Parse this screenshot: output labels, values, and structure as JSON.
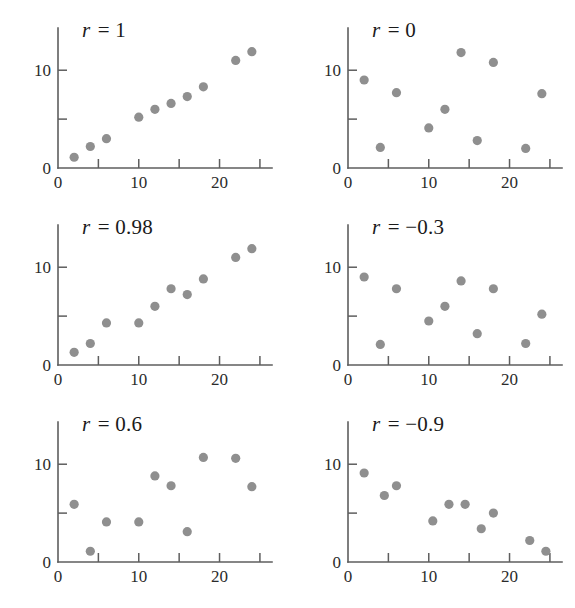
{
  "figure": {
    "background_color": "#ffffff",
    "dot_color": "#8f8f8f",
    "axis_color": "#5e5e5e",
    "text_color": "#1a1a1a",
    "rows": 3,
    "columns": 2
  },
  "chart_data": [
    {
      "type": "scatter",
      "title": "r = 1",
      "r_symbol": "r",
      "r_value": "= 1",
      "xlabel": "",
      "ylabel": "",
      "xlim": [
        0,
        26
      ],
      "ylim": [
        0,
        13.5
      ],
      "grid": false,
      "legend": "none",
      "xticks": [
        0,
        5,
        10,
        15,
        20,
        25
      ],
      "xticklabels": [
        "0",
        "",
        "10",
        "",
        "20",
        ""
      ],
      "yticks": [
        0,
        5,
        10
      ],
      "yticklabels": [
        "0",
        "",
        "10"
      ],
      "x": [
        2,
        4,
        6,
        10,
        12,
        14,
        16,
        18,
        22,
        24
      ],
      "y": [
        1.1,
        2.2,
        3.0,
        5.2,
        6.0,
        6.6,
        7.3,
        8.3,
        11.0,
        11.9
      ]
    },
    {
      "type": "scatter",
      "title": "r = 0",
      "r_symbol": "r",
      "r_value": "= 0",
      "xlabel": "",
      "ylabel": "",
      "xlim": [
        0,
        26
      ],
      "ylim": [
        0,
        13.5
      ],
      "grid": false,
      "legend": "none",
      "xticks": [
        0,
        5,
        10,
        15,
        20,
        25
      ],
      "xticklabels": [
        "0",
        "",
        "10",
        "",
        "20",
        ""
      ],
      "yticks": [
        0,
        5,
        10
      ],
      "yticklabels": [
        "0",
        "",
        "10"
      ],
      "x": [
        2,
        4,
        6,
        10,
        12,
        14,
        16,
        18,
        22,
        24
      ],
      "y": [
        9.0,
        2.1,
        7.7,
        4.1,
        6.0,
        11.8,
        2.8,
        10.8,
        2.0,
        7.6
      ]
    },
    {
      "type": "scatter",
      "title": "r = 0.98",
      "r_symbol": "r",
      "r_value": "= 0.98",
      "xlabel": "",
      "ylabel": "",
      "xlim": [
        0,
        26
      ],
      "ylim": [
        0,
        13.5
      ],
      "grid": false,
      "legend": "none",
      "xticks": [
        0,
        5,
        10,
        15,
        20,
        25
      ],
      "xticklabels": [
        "0",
        "",
        "10",
        "",
        "20",
        ""
      ],
      "yticks": [
        0,
        5,
        10
      ],
      "yticklabels": [
        "0",
        "",
        "10"
      ],
      "x": [
        2,
        4,
        6,
        10,
        12,
        14,
        16,
        18,
        22,
        24
      ],
      "y": [
        1.3,
        2.2,
        4.3,
        4.3,
        6.0,
        7.8,
        7.2,
        8.8,
        11.0,
        11.9
      ]
    },
    {
      "type": "scatter",
      "title": "r = −0.3",
      "r_symbol": "r",
      "r_value": "= −0.3",
      "xlabel": "",
      "ylabel": "",
      "xlim": [
        0,
        26
      ],
      "ylim": [
        0,
        13.5
      ],
      "grid": false,
      "legend": "none",
      "xticks": [
        0,
        5,
        10,
        15,
        20,
        25
      ],
      "xticklabels": [
        "0",
        "",
        "10",
        "",
        "20",
        ""
      ],
      "yticks": [
        0,
        5,
        10
      ],
      "yticklabels": [
        "0",
        "",
        "10"
      ],
      "x": [
        2,
        4,
        6,
        10,
        12,
        14,
        16,
        18,
        22,
        24
      ],
      "y": [
        9.0,
        2.1,
        7.8,
        4.5,
        6.0,
        8.6,
        3.2,
        7.8,
        2.2,
        5.2
      ]
    },
    {
      "type": "scatter",
      "title": "r = 0.6",
      "r_symbol": "r",
      "r_value": "= 0.6",
      "xlabel": "",
      "ylabel": "",
      "xlim": [
        0,
        26
      ],
      "ylim": [
        0,
        13.5
      ],
      "grid": false,
      "legend": "none",
      "xticks": [
        0,
        5,
        10,
        15,
        20,
        25
      ],
      "xticklabels": [
        "0",
        "",
        "10",
        "",
        "20",
        ""
      ],
      "yticks": [
        0,
        5,
        10
      ],
      "yticklabels": [
        "0",
        "",
        "10"
      ],
      "x": [
        2,
        4,
        6,
        10,
        12,
        14,
        16,
        18,
        22,
        24
      ],
      "y": [
        5.9,
        1.1,
        4.1,
        4.1,
        8.8,
        7.8,
        3.1,
        10.7,
        10.6,
        7.7
      ]
    },
    {
      "type": "scatter",
      "title": "r = −0.9",
      "r_symbol": "r",
      "r_value": "= −0.9",
      "xlabel": "",
      "ylabel": "",
      "xlim": [
        0,
        26
      ],
      "ylim": [
        0,
        13.5
      ],
      "grid": false,
      "legend": "none",
      "xticks": [
        0,
        5,
        10,
        15,
        20,
        25
      ],
      "xticklabels": [
        "0",
        "",
        "10",
        "",
        "20",
        ""
      ],
      "yticks": [
        0,
        5,
        10
      ],
      "yticklabels": [
        "0",
        "",
        "10"
      ],
      "x": [
        2,
        4.5,
        6,
        10.5,
        12.5,
        14.5,
        16.5,
        18,
        22.5,
        24.5
      ],
      "y": [
        9.1,
        6.8,
        7.8,
        4.2,
        5.9,
        5.9,
        3.4,
        5.0,
        2.2,
        1.1
      ]
    }
  ]
}
